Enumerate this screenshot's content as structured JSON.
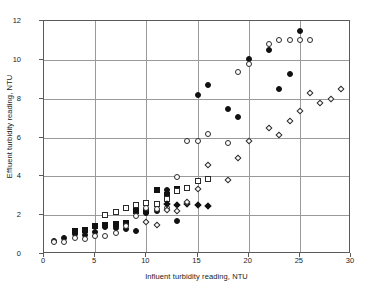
{
  "chart_data": {
    "type": "scatter",
    "title": "",
    "xlabel": "Influent turbidity reading, NTU",
    "ylabel": "Effluent turbidity reading, NTU",
    "xlim": [
      0,
      30
    ],
    "ylim": [
      0,
      12
    ],
    "xticks": [
      0,
      5,
      10,
      15,
      20,
      25,
      30
    ],
    "yticks": [
      0,
      2,
      4,
      6,
      8,
      10,
      12
    ],
    "grid": true,
    "legend": "none",
    "series": [
      {
        "name": "filled-square",
        "marker": "filled-square",
        "points": [
          [
            3,
            1.2
          ],
          [
            4,
            1.25
          ],
          [
            5,
            1.45
          ],
          [
            6,
            1.5
          ],
          [
            7,
            1.55
          ],
          [
            8,
            1.6
          ],
          [
            9,
            2.2
          ],
          [
            10,
            2.2
          ],
          [
            11,
            3.3
          ],
          [
            12,
            3.05
          ],
          [
            13,
            3.35
          ]
        ]
      },
      {
        "name": "open-square",
        "marker": "open-square",
        "points": [
          [
            6,
            2.0
          ],
          [
            7,
            2.15
          ],
          [
            8,
            2.35
          ],
          [
            9,
            2.5
          ],
          [
            10,
            2.65
          ],
          [
            11,
            2.55
          ],
          [
            12,
            2.85
          ],
          [
            13,
            3.25
          ],
          [
            14,
            3.4
          ],
          [
            15,
            3.75
          ],
          [
            16,
            3.85
          ]
        ]
      },
      {
        "name": "filled-circle",
        "marker": "filled-circle",
        "points": [
          [
            1,
            0.65
          ],
          [
            2,
            0.8
          ],
          [
            3,
            1.05
          ],
          [
            4,
            1.0
          ],
          [
            5,
            1.15
          ],
          [
            6,
            1.4
          ],
          [
            7,
            1.35
          ],
          [
            8,
            1.3
          ],
          [
            9,
            1.2
          ],
          [
            10,
            2.1
          ],
          [
            11,
            2.2
          ],
          [
            12,
            3.3
          ],
          [
            13,
            1.7
          ],
          [
            15,
            8.2
          ],
          [
            16,
            8.7
          ],
          [
            18,
            7.45
          ],
          [
            19,
            7.05
          ],
          [
            20,
            10.05
          ],
          [
            22,
            10.5
          ],
          [
            23,
            8.5
          ],
          [
            24,
            9.25
          ],
          [
            25,
            11.5
          ]
        ]
      },
      {
        "name": "open-circle",
        "marker": "open-circle",
        "points": [
          [
            1,
            0.6
          ],
          [
            2,
            0.6
          ],
          [
            3,
            0.8
          ],
          [
            4,
            0.75
          ],
          [
            5,
            0.95
          ],
          [
            6,
            0.95
          ],
          [
            7,
            1.1
          ],
          [
            8,
            1.45
          ],
          [
            9,
            1.95
          ],
          [
            10,
            2.35
          ],
          [
            11,
            2.3
          ],
          [
            12,
            2.35
          ],
          [
            13,
            3.95
          ],
          [
            14,
            5.8
          ],
          [
            15,
            5.8
          ],
          [
            16,
            6.2
          ],
          [
            18,
            5.7
          ],
          [
            19,
            9.35
          ],
          [
            20,
            9.8
          ],
          [
            22,
            10.8
          ],
          [
            23,
            11.0
          ],
          [
            24,
            11.0
          ],
          [
            25,
            11.0
          ],
          [
            26,
            11.0
          ]
        ]
      },
      {
        "name": "filled-diamond",
        "marker": "filled-diamond",
        "points": [
          [
            12,
            2.55
          ],
          [
            13,
            2.5
          ],
          [
            14,
            2.55
          ],
          [
            15,
            2.5
          ],
          [
            16,
            2.45
          ]
        ]
      },
      {
        "name": "open-diamond",
        "marker": "open-diamond",
        "points": [
          [
            10,
            1.65
          ],
          [
            11,
            1.5
          ],
          [
            12,
            2.25
          ],
          [
            13,
            2.2
          ],
          [
            14,
            2.7
          ],
          [
            15,
            3.35
          ],
          [
            16,
            4.6
          ],
          [
            18,
            3.8
          ],
          [
            19,
            4.95
          ],
          [
            20,
            5.8
          ],
          [
            22,
            6.5
          ],
          [
            23,
            6.15
          ],
          [
            24,
            6.85
          ],
          [
            25,
            7.35
          ],
          [
            26,
            8.3
          ],
          [
            27,
            7.8
          ],
          [
            28,
            8.0
          ],
          [
            29,
            8.5
          ]
        ]
      }
    ]
  }
}
